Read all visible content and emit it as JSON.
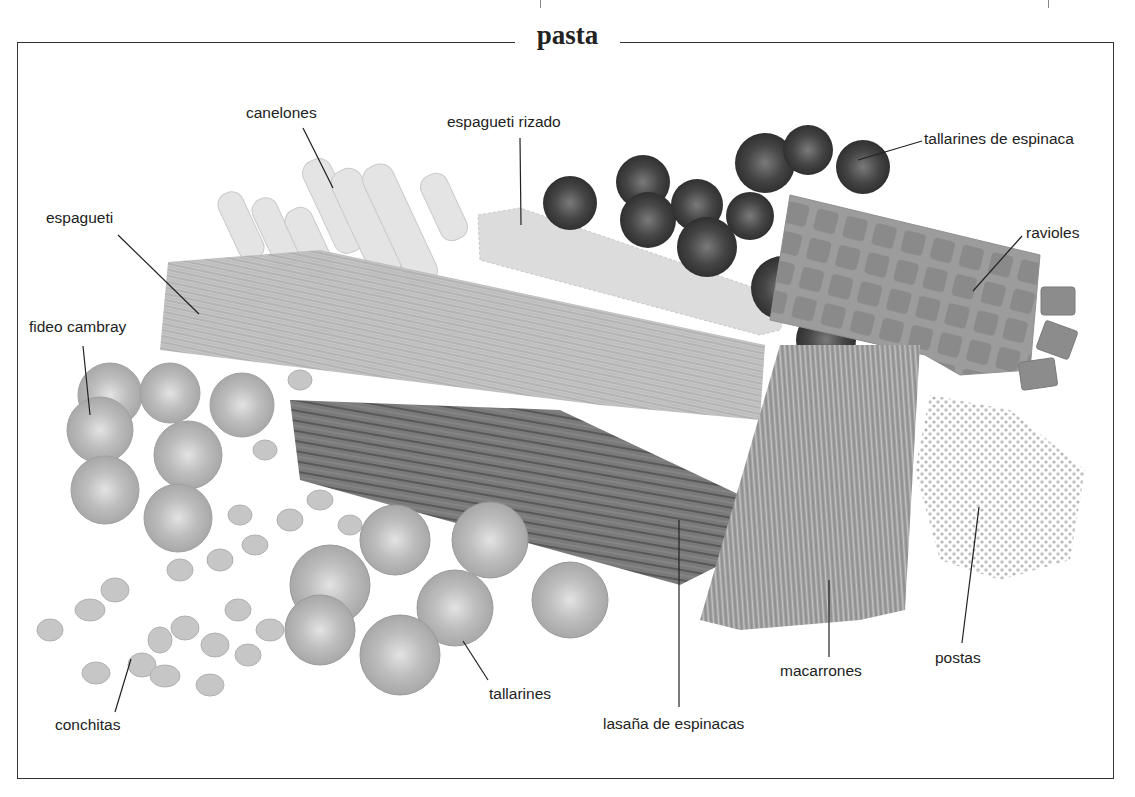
{
  "page": {
    "title": "pasta"
  },
  "labels": [
    {
      "id": "canelones",
      "text": "canelones",
      "x": 246,
      "y": 104
    },
    {
      "id": "espagueti-rizado",
      "text": "espagueti rizado",
      "x": 447,
      "y": 113
    },
    {
      "id": "tallarines-de-espinaca",
      "text": "tallarines de espinaca",
      "x": 924,
      "y": 130
    },
    {
      "id": "espagueti",
      "text": "espagueti",
      "x": 46,
      "y": 209
    },
    {
      "id": "ravioles",
      "text": "ravioles",
      "x": 1026,
      "y": 224
    },
    {
      "id": "fideo-cambray",
      "text": "fideo cambray",
      "x": 29,
      "y": 318
    },
    {
      "id": "postas",
      "text": "postas",
      "x": 935,
      "y": 649
    },
    {
      "id": "macarrones",
      "text": "macarrones",
      "x": 780,
      "y": 662
    },
    {
      "id": "tallarines",
      "text": "tallarines",
      "x": 489,
      "y": 685
    },
    {
      "id": "conchitas",
      "text": "conchitas",
      "x": 55,
      "y": 716
    },
    {
      "id": "lasana-de-espinacas",
      "text": "lasaña de espinacas",
      "x": 603,
      "y": 715
    }
  ],
  "colors": {
    "frame": "#333333",
    "text": "#222222",
    "pasta_light": "#cfcfcf",
    "pasta_mid": "#a9a9a9",
    "pasta_dark": "#5a5a5a"
  }
}
